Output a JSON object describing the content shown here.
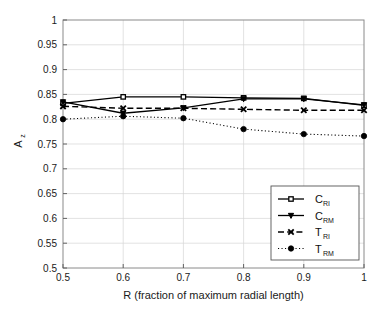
{
  "chart_data": {
    "type": "line",
    "title": "",
    "xlabel": "R (fraction of maximum radial length)",
    "ylabel": "A_z",
    "ylabel_base": "A",
    "ylabel_sub": "z",
    "x": [
      0.5,
      0.6,
      0.7,
      0.8,
      0.9,
      1.0
    ],
    "xlim": [
      0.5,
      1.0
    ],
    "ylim": [
      0.5,
      1.0
    ],
    "xticks": [
      0.5,
      0.6,
      0.7,
      0.8,
      0.9,
      1.0
    ],
    "xtick_labels": [
      "0.5",
      "0.6",
      "0.7",
      "0.8",
      "0.9",
      "1"
    ],
    "yticks": [
      0.5,
      0.55,
      0.6,
      0.65,
      0.7,
      0.75,
      0.8,
      0.85,
      0.9,
      0.95,
      1.0
    ],
    "ytick_labels": [
      "0.5",
      "0.55",
      "0.6",
      "0.65",
      "0.7",
      "0.75",
      "0.8",
      "0.85",
      "0.9",
      "0.95",
      "1"
    ],
    "grid": true,
    "legend_position": "lower right",
    "series": [
      {
        "name": "C_RI",
        "label_base": "C",
        "label_sub": "RI",
        "marker": "square-open",
        "linestyle": "solid",
        "color": "#000000",
        "values": [
          0.832,
          0.845,
          0.845,
          0.843,
          0.842,
          0.828
        ]
      },
      {
        "name": "C_RM",
        "label_base": "C",
        "label_sub": "RM",
        "marker": "triangle-down-filled",
        "linestyle": "solid",
        "color": "#000000",
        "values": [
          0.835,
          0.812,
          0.823,
          0.841,
          0.841,
          0.829
        ]
      },
      {
        "name": "T_RI",
        "label_base": "T",
        "label_sub": "RI",
        "marker": "x-filled",
        "linestyle": "dashed",
        "color": "#000000",
        "values": [
          0.826,
          0.822,
          0.822,
          0.82,
          0.818,
          0.818
        ]
      },
      {
        "name": "T_RM",
        "label_base": "T",
        "label_sub": "RM",
        "marker": "circle-filled",
        "linestyle": "dotted",
        "color": "#000000",
        "values": [
          0.8,
          0.806,
          0.802,
          0.78,
          0.77,
          0.766
        ]
      }
    ]
  }
}
